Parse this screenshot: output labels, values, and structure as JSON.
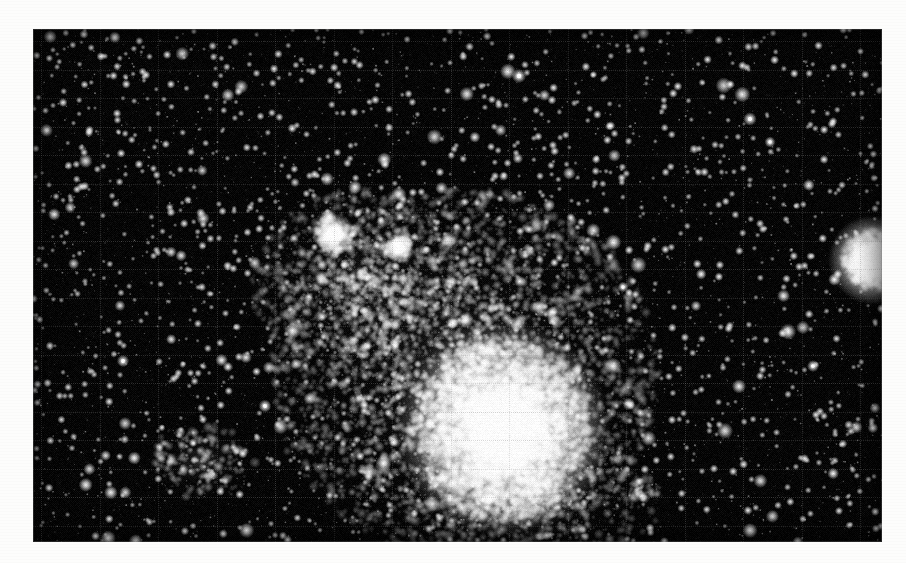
{
  "page": {
    "width": 906,
    "height": 563,
    "background_color": "#fdfdfc",
    "kind": "photographic-plate-scan",
    "caption": ""
  },
  "plate": {
    "x": 33,
    "y": 29,
    "width": 849,
    "height": 513,
    "sky_color": "#050505",
    "star_color": "#ffffff",
    "border_color": "#787878",
    "label": ""
  },
  "grid": {
    "visible": true,
    "color": "#6e6e6e",
    "opacity": 0.3,
    "line_width": 1,
    "vertical_spacing": 58.5,
    "vertical_offset": 8,
    "horizontal_spacing": 28.5,
    "horizontal_offset": 12,
    "style": "fine-ruled-reseau"
  },
  "field": {
    "description": "Dense stellar field on black sky",
    "background_star_count": 5200,
    "background_star_min_radius": 0.45,
    "background_star_max_radius": 2.3,
    "bright_field_star_count": 120,
    "bright_field_star_min_radius": 2.2,
    "bright_field_star_max_radius": 4.2
  },
  "chart_data": {
    "type": "scatter",
    "title": "",
    "xlabel": "",
    "ylabel": "",
    "objects": [
      {
        "name": "main-cluster-core",
        "kind": "globular-cluster-core",
        "cx": 470,
        "cy": 400,
        "rx": 86,
        "ry": 92,
        "peak_brightness": 1.0,
        "star_count": 3400,
        "note": "Saturated white core of the principal cluster"
      },
      {
        "name": "main-cluster-halo",
        "kind": "cluster-halo",
        "cx": 432,
        "cy": 345,
        "rx": 195,
        "ry": 185,
        "peak_brightness": 0.55,
        "star_count": 4200,
        "note": "Extended resolved halo reaching up and to the left"
      },
      {
        "name": "northwest-plume",
        "kind": "cluster-extension",
        "cx": 330,
        "cy": 255,
        "rx": 110,
        "ry": 95,
        "peak_brightness": 0.4,
        "star_count": 1500,
        "note": "Fan of resolved stars north-west of the core"
      },
      {
        "name": "bright-knot-upper-left",
        "kind": "bright-knot",
        "cx": 301,
        "cy": 205,
        "rx": 20,
        "ry": 17,
        "peak_brightness": 0.98,
        "star_count": 140
      },
      {
        "name": "bright-knot-upper-right",
        "kind": "bright-knot",
        "cx": 366,
        "cy": 219,
        "rx": 15,
        "ry": 12,
        "peak_brightness": 0.94,
        "star_count": 90
      },
      {
        "name": "companion-cluster-right",
        "kind": "compact-globular-cluster",
        "cx": 840,
        "cy": 231,
        "rx": 30,
        "ry": 29,
        "peak_brightness": 1.0,
        "star_count": 620,
        "note": "Compact bright companion cluster near the right edge"
      },
      {
        "name": "star-association-lower-left",
        "kind": "loose-association",
        "cx": 168,
        "cy": 432,
        "rx": 52,
        "ry": 38,
        "peak_brightness": 0.62,
        "star_count": 190
      },
      {
        "name": "southern-cluster-skirt",
        "kind": "cluster-halo",
        "cx": 500,
        "cy": 470,
        "rx": 130,
        "ry": 70,
        "peak_brightness": 0.32,
        "star_count": 900
      },
      {
        "name": "eastern-knot",
        "kind": "bright-knot",
        "cx": 608,
        "cy": 462,
        "rx": 13,
        "ry": 10,
        "peak_brightness": 0.72,
        "star_count": 45
      }
    ],
    "notable_stars": [
      {
        "name": "bright-star-top",
        "x": 486,
        "y": 47,
        "radius": 3.6
      },
      {
        "name": "bright-star-upper-right",
        "x": 717,
        "y": 90,
        "radius": 3.4
      },
      {
        "name": "bright-star-right-edge",
        "x": 737,
        "y": 113,
        "radius": 2.8
      },
      {
        "name": "bright-star-far-right",
        "x": 857,
        "y": 112,
        "radius": 3.0
      },
      {
        "name": "bright-star-left-mid",
        "x": 90,
        "y": 332,
        "radius": 3.1
      },
      {
        "name": "bright-star-left-low",
        "x": 232,
        "y": 377,
        "radius": 3.2
      },
      {
        "name": "bright-star-bottom",
        "x": 432,
        "y": 519,
        "radius": 3.3
      },
      {
        "name": "bright-star-bottom-right",
        "x": 629,
        "y": 540,
        "radius": 2.9
      },
      {
        "name": "bright-star-mid-right",
        "x": 780,
        "y": 337,
        "radius": 3.0
      },
      {
        "name": "bright-star-upper-mid",
        "x": 590,
        "y": 258,
        "radius": 2.7
      }
    ]
  }
}
